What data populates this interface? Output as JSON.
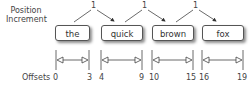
{
  "labels": {
    "position_increment_line1": "Position",
    "position_increment_line2": "Increment",
    "offsets": "Offsets"
  },
  "tokens": [
    {
      "text": "the",
      "start": "0",
      "end": "3"
    },
    {
      "text": "quick",
      "start": "4",
      "end": "9"
    },
    {
      "text": "brown",
      "start": "10",
      "end": "15"
    },
    {
      "text": "fox",
      "start": "16",
      "end": "19"
    }
  ],
  "increments": [
    "1",
    "1",
    "1"
  ]
}
